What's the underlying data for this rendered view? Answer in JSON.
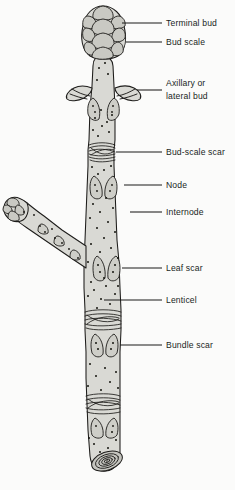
{
  "figure": {
    "background_color": "#fbfbfa",
    "stem_fill_color": "#d9d9d4",
    "outline_color": "#1d1c1a",
    "label_color": "#201f1d"
  },
  "labels": [
    {
      "id": "terminal-bud",
      "text": "Terminal bud",
      "text_x": 166,
      "text_y": 26,
      "line_x1": 122,
      "line_y1": 23,
      "line_x2": 162,
      "line_y2": 23
    },
    {
      "id": "bud-scale",
      "text": "Bud scale",
      "text_x": 166,
      "text_y": 45,
      "line_x1": 126,
      "line_y1": 42,
      "line_x2": 162,
      "line_y2": 42
    },
    {
      "id": "axillary-bud",
      "text": "Axillary or",
      "text_x": 166,
      "text_y": 86,
      "line_x1": 137,
      "line_y1": 90,
      "line_x2": 162,
      "line_y2": 90,
      "text2": "lateral bud",
      "text2_x": 166,
      "text2_y": 99
    },
    {
      "id": "bud-scale-scar",
      "text": "Bud-scale scar",
      "text_x": 166,
      "text_y": 155,
      "line_x1": 116,
      "line_y1": 152,
      "line_x2": 162,
      "line_y2": 152
    },
    {
      "id": "node",
      "text": "Node",
      "text_x": 166,
      "text_y": 188,
      "line_x1": 124,
      "line_y1": 185,
      "line_x2": 162,
      "line_y2": 185
    },
    {
      "id": "internode",
      "text": "Internode",
      "text_x": 166,
      "text_y": 215,
      "line_x1": 130,
      "line_y1": 212,
      "line_x2": 162,
      "line_y2": 212
    },
    {
      "id": "leaf-scar",
      "text": "Leaf scar",
      "text_x": 166,
      "text_y": 271,
      "line_x1": 122,
      "line_y1": 268,
      "line_x2": 162,
      "line_y2": 268
    },
    {
      "id": "lenticel",
      "text": "Lenticel",
      "text_x": 166,
      "text_y": 303,
      "line_x1": 104,
      "line_y1": 300,
      "line_x2": 162,
      "line_y2": 300
    },
    {
      "id": "bundle-scar",
      "text": "Bundle scar",
      "text_x": 166,
      "text_y": 348,
      "line_x1": 120,
      "line_y1": 345,
      "line_x2": 162,
      "line_y2": 345
    }
  ],
  "parts": {
    "terminal_bud_label": "Terminal bud",
    "bud_scale_label": "Bud scale",
    "axillary_bud_label": "Axillary or lateral bud",
    "bud_scale_scar_label": "Bud-scale scar",
    "node_label": "Node",
    "internode_label": "Internode",
    "leaf_scar_label": "Leaf scar",
    "lenticel_label": "Lenticel",
    "bundle_scar_label": "Bundle scar"
  }
}
